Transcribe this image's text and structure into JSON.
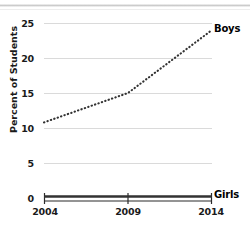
{
  "chart_data": {
    "type": "line",
    "title": "",
    "subtitle": "",
    "xlabel": "",
    "ylabel": "Percent of Students",
    "x": [
      2004,
      2009,
      2014
    ],
    "xtick_labels": [
      "2004",
      "2009",
      "2014"
    ],
    "ytick_labels": [
      "0",
      "5",
      "10",
      "15",
      "20",
      "25"
    ],
    "ylim": [
      0,
      25
    ],
    "xlim": [
      2004,
      2014
    ],
    "grid": "horizontal",
    "legend_position": "inline-right-of-series-end",
    "series": [
      {
        "name": "Boys",
        "label": "Boys",
        "style": "dotted",
        "color": "#333333",
        "values": [
          10.8,
          15.0,
          24.0
        ]
      },
      {
        "name": "Girls",
        "label": "Girls",
        "style": "solid-thick",
        "color": "#333333",
        "values": [
          0.2,
          0.2,
          0.2
        ]
      }
    ]
  },
  "axes": {
    "y_title": "Percent of Students",
    "y_ticks": [
      {
        "label": "25",
        "value": 25
      },
      {
        "label": "20",
        "value": 20
      },
      {
        "label": "15",
        "value": 15
      },
      {
        "label": "10",
        "value": 10
      },
      {
        "label": "5",
        "value": 5
      },
      {
        "label": "0",
        "value": 0
      }
    ],
    "x_ticks": [
      {
        "label": "2004",
        "value": 2004
      },
      {
        "label": "2009",
        "value": 2009
      },
      {
        "label": "2014",
        "value": 2014
      }
    ]
  },
  "labels": {
    "boys": "Boys",
    "girls": "Girls"
  },
  "colors": {
    "grid": "#dadada",
    "series": "#333333",
    "text": "#1a1a1a",
    "background": "#ffffff"
  }
}
